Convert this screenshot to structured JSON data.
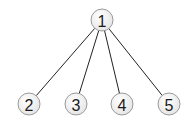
{
  "diagram": {
    "type": "tree",
    "node_radius": 11,
    "colors": {
      "edge": "#222222",
      "node_fill_center": "#ffffff",
      "node_fill_edge": "#e4e4e4",
      "node_stroke": "#9a9a9a",
      "label": "#1a1a1a"
    },
    "nodes": [
      {
        "id": "1",
        "label": "1",
        "x": 102,
        "y": 20
      },
      {
        "id": "2",
        "label": "2",
        "x": 29,
        "y": 104
      },
      {
        "id": "3",
        "label": "3",
        "x": 76,
        "y": 104
      },
      {
        "id": "4",
        "label": "4",
        "x": 122,
        "y": 104
      },
      {
        "id": "5",
        "label": "5",
        "x": 169,
        "y": 104
      }
    ],
    "edges": [
      {
        "from": "1",
        "to": "2"
      },
      {
        "from": "1",
        "to": "3"
      },
      {
        "from": "1",
        "to": "4"
      },
      {
        "from": "1",
        "to": "5"
      }
    ]
  }
}
